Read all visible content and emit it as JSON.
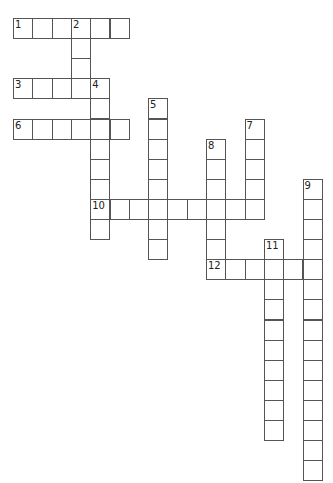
{
  "puzzle": {
    "cell_width": 19.3,
    "cell_height": 20.1,
    "origin_x": 13,
    "origin_y": 18,
    "entries": [
      {
        "number": "1",
        "direction": "across",
        "row": 0,
        "col": 0,
        "length": 6
      },
      {
        "number": "2",
        "direction": "down",
        "row": 0,
        "col": 3,
        "length": 4
      },
      {
        "number": "3",
        "direction": "across",
        "row": 3,
        "col": 0,
        "length": 5
      },
      {
        "number": "4",
        "direction": "down",
        "row": 3,
        "col": 4,
        "length": 8
      },
      {
        "number": "5",
        "direction": "down",
        "row": 4,
        "col": 7,
        "length": 8
      },
      {
        "number": "6",
        "direction": "across",
        "row": 5,
        "col": 0,
        "length": 6
      },
      {
        "number": "7",
        "direction": "down",
        "row": 5,
        "col": 12,
        "length": 5
      },
      {
        "number": "8",
        "direction": "down",
        "row": 6,
        "col": 10,
        "length": 7
      },
      {
        "number": "9",
        "direction": "down",
        "row": 8,
        "col": 15,
        "length": 15
      },
      {
        "number": "10",
        "direction": "across",
        "row": 9,
        "col": 4,
        "length": 9
      },
      {
        "number": "11",
        "direction": "down",
        "row": 11,
        "col": 13,
        "length": 10
      },
      {
        "number": "12",
        "direction": "across",
        "row": 12,
        "col": 10,
        "length": 6
      }
    ]
  },
  "colors": {
    "border": "#555555",
    "number_text": "#222222",
    "background": "#ffffff"
  }
}
